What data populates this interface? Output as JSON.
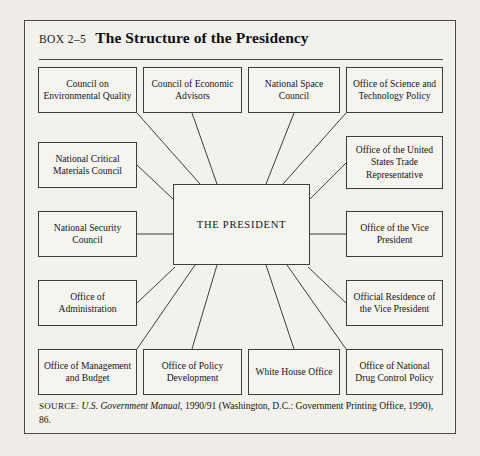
{
  "figure": {
    "box_label": "BOX 2–5",
    "title": "The Structure of the Presidency",
    "center": {
      "label": "THE PRESIDENT"
    },
    "nodes": [
      {
        "id": "council-environmental-quality",
        "label": "Council on Environmental Quality",
        "x": 13,
        "y": 46,
        "w": 99,
        "h": 46
      },
      {
        "id": "council-economic-advisors",
        "label": "Council of Economic Advisors",
        "x": 118,
        "y": 46,
        "w": 99,
        "h": 46
      },
      {
        "id": "national-space-council",
        "label": "National Space Council",
        "x": 223,
        "y": 46,
        "w": 92,
        "h": 46
      },
      {
        "id": "office-science-technology",
        "label": "Office of Science and Technology Policy",
        "x": 321,
        "y": 46,
        "w": 97,
        "h": 46
      },
      {
        "id": "national-critical-materials",
        "label": "National Critical Materials Council",
        "x": 13,
        "y": 121,
        "w": 99,
        "h": 46
      },
      {
        "id": "office-us-trade-rep",
        "label": "Office of the United States Trade Representative",
        "x": 321,
        "y": 115,
        "w": 97,
        "h": 53
      },
      {
        "id": "national-security-council",
        "label": "National Security Council",
        "x": 13,
        "y": 190,
        "w": 99,
        "h": 46
      },
      {
        "id": "office-vice-president",
        "label": "Office of the Vice President",
        "x": 321,
        "y": 190,
        "w": 97,
        "h": 46
      },
      {
        "id": "office-administration",
        "label": "Office of Administration",
        "x": 13,
        "y": 259,
        "w": 99,
        "h": 46
      },
      {
        "id": "official-residence-vp",
        "label": "Official Residence of the Vice President",
        "x": 321,
        "y": 259,
        "w": 97,
        "h": 46
      },
      {
        "id": "office-management-budget",
        "label": "Office of Management and Budget",
        "x": 13,
        "y": 328,
        "w": 99,
        "h": 46
      },
      {
        "id": "office-policy-development",
        "label": "Office of Policy Development",
        "x": 118,
        "y": 328,
        "w": 99,
        "h": 46
      },
      {
        "id": "white-house-office",
        "label": "White House Office",
        "x": 223,
        "y": 328,
        "w": 92,
        "h": 46
      },
      {
        "id": "office-national-drug-control",
        "label": "Office of National Drug Control Policy",
        "x": 321,
        "y": 328,
        "w": 97,
        "h": 46
      }
    ],
    "center_box": {
      "x": 148,
      "y": 163,
      "w": 137,
      "h": 81
    },
    "connectors": [
      {
        "from": "council-environmental-quality",
        "x1": 112,
        "y1": 92,
        "x2": 175,
        "y2": 163
      },
      {
        "from": "council-economic-advisors",
        "x1": 167,
        "y1": 92,
        "x2": 192,
        "y2": 163
      },
      {
        "from": "national-space-council",
        "x1": 269,
        "y1": 92,
        "x2": 241,
        "y2": 163
      },
      {
        "from": "office-science-technology",
        "x1": 321,
        "y1": 92,
        "x2": 258,
        "y2": 163
      },
      {
        "from": "national-critical-materials",
        "x1": 112,
        "y1": 144,
        "x2": 148,
        "y2": 178
      },
      {
        "from": "office-us-trade-rep",
        "x1": 321,
        "y1": 142,
        "x2": 285,
        "y2": 178
      },
      {
        "from": "national-security-council",
        "x1": 112,
        "y1": 213,
        "x2": 148,
        "y2": 213
      },
      {
        "from": "office-vice-president",
        "x1": 321,
        "y1": 213,
        "x2": 285,
        "y2": 213
      },
      {
        "from": "office-administration",
        "x1": 112,
        "y1": 282,
        "x2": 150,
        "y2": 246
      },
      {
        "from": "official-residence-vp",
        "x1": 321,
        "y1": 282,
        "x2": 283,
        "y2": 246
      },
      {
        "from": "office-management-budget",
        "x1": 112,
        "y1": 328,
        "x2": 170,
        "y2": 244
      },
      {
        "from": "office-policy-development",
        "x1": 167,
        "y1": 328,
        "x2": 192,
        "y2": 244
      },
      {
        "from": "white-house-office",
        "x1": 269,
        "y1": 328,
        "x2": 241,
        "y2": 244
      },
      {
        "from": "office-national-drug-control",
        "x1": 321,
        "y1": 328,
        "x2": 262,
        "y2": 244
      }
    ]
  },
  "source": {
    "prefix": "SOURCE:",
    "italic_title": "U.S. Government Manual,",
    "rest": " 1990/91 (Washington, D.C.: Government Printing Office, 1990), 86."
  },
  "colors": {
    "page_background": "#efece7",
    "figure_background": "#f3f1ec",
    "node_background": "#f6f4ef",
    "border": "#3d3d3d",
    "text": "#15151a"
  }
}
